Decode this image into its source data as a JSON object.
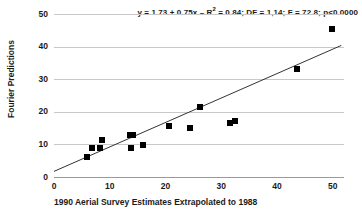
{
  "chart_data": {
    "type": "scatter",
    "title_parts": {
      "equation": "y = 1.73 + 0.75x",
      "dash": "–",
      "r_squared_prefix": "R",
      "r_squared_exponent": "2",
      "r_squared_value": " = 0.84;",
      "df": "DF = 1,14;",
      "f_stat": "F = 72.8;",
      "p_value": "p<0.0000"
    },
    "xlabel": "1990 Aerial Survey Estimates Extrapolated to 1988",
    "ylabel": "Fourier Predictions",
    "xlim": [
      0,
      52
    ],
    "ylim": [
      0,
      50
    ],
    "xticks": [
      "0",
      "10",
      "20",
      "30",
      "40",
      "50"
    ],
    "xtick_values": [
      0,
      10,
      20,
      30,
      40,
      50
    ],
    "yticks": [
      "0",
      "10",
      "20",
      "30",
      "40",
      "50"
    ],
    "ytick_values": [
      0,
      10,
      20,
      30,
      40,
      50
    ],
    "grid": "horizontal",
    "legend": "none",
    "marker_style": "filled-square",
    "marker_color": "#000000",
    "gridline_color": "#c8c8c8",
    "fit_line_color": "#333333",
    "fit_line": {
      "intercept": 1.73,
      "slope": 0.75,
      "x_start": 0,
      "x_end": 51.5
    },
    "points": [
      {
        "x": 5.9,
        "y": 6.0
      },
      {
        "x": 6.8,
        "y": 8.8
      },
      {
        "x": 8.3,
        "y": 8.8
      },
      {
        "x": 8.6,
        "y": 11.5
      },
      {
        "x": 13.6,
        "y": 12.8
      },
      {
        "x": 14.2,
        "y": 12.9
      },
      {
        "x": 13.8,
        "y": 9.0
      },
      {
        "x": 16.0,
        "y": 9.9
      },
      {
        "x": 20.7,
        "y": 15.6
      },
      {
        "x": 24.3,
        "y": 15.0
      },
      {
        "x": 26.1,
        "y": 21.4
      },
      {
        "x": 31.6,
        "y": 16.5
      },
      {
        "x": 32.5,
        "y": 17.2
      },
      {
        "x": 43.5,
        "y": 33.0
      },
      {
        "x": 49.8,
        "y": 45.3
      }
    ]
  }
}
